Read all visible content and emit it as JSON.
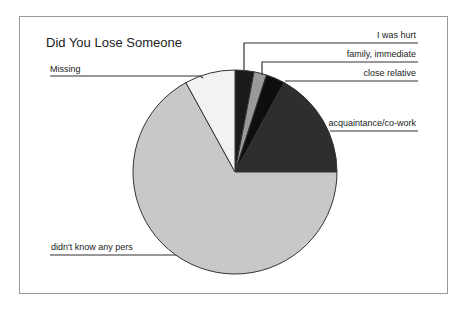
{
  "chart_data": {
    "type": "pie",
    "title": "Did You Lose Someone",
    "categories": [
      "I was hurt",
      "family, immediate",
      "close relative",
      "acquaintance/co-work",
      "didn't know any pers",
      "Missing"
    ],
    "values": [
      3,
      2,
      3,
      17,
      67,
      8
    ],
    "colors": [
      "#1a1a1a",
      "#9a9a9a",
      "#0e0e0e",
      "#2e2e2e",
      "#c8c8c8",
      "#f2f2f2"
    ],
    "start_angle_deg": 0,
    "direction": "clockwise",
    "legend": "leader-line labels",
    "grid": false
  },
  "labels": {
    "title": "Did You Lose Someone",
    "i_was_hurt": "I was hurt",
    "family_immediate": "family, immediate",
    "close_relative": "close relative",
    "acquaintance": "acquaintance/co-work",
    "didnt_know": "didn't know any pers",
    "missing": "Missing"
  }
}
